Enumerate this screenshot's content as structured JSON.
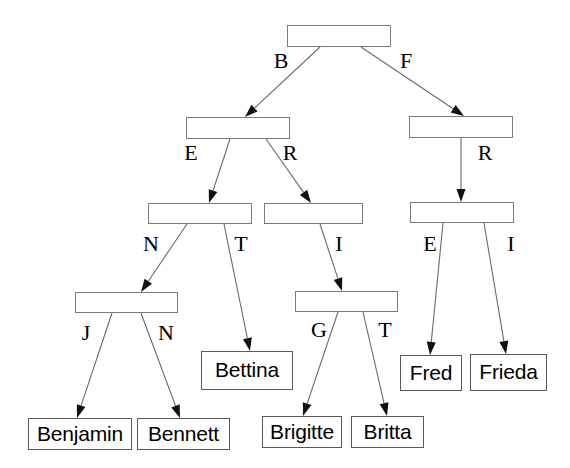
{
  "diagram": {
    "type": "trie",
    "background_color": "#ffffff",
    "box_stroke_color": "#7a7a7a",
    "edge_stroke_color": "#6a6a6a",
    "arrow_fill_color": "#111111",
    "text_color": "#000000"
  },
  "nodes": [
    {
      "id": "root",
      "label": "",
      "kind": "internal",
      "x": 287,
      "y": 25,
      "w": 104,
      "h": 22
    },
    {
      "id": "b",
      "label": "",
      "kind": "internal",
      "x": 186,
      "y": 117,
      "w": 104,
      "h": 22
    },
    {
      "id": "f",
      "label": "",
      "kind": "internal",
      "x": 409,
      "y": 116,
      "w": 104,
      "h": 22
    },
    {
      "id": "be",
      "label": "",
      "kind": "internal",
      "x": 148,
      "y": 203,
      "w": 104,
      "h": 21
    },
    {
      "id": "br",
      "label": "",
      "kind": "internal",
      "x": 264,
      "y": 203,
      "w": 99,
      "h": 21
    },
    {
      "id": "fr",
      "label": "",
      "kind": "internal",
      "x": 410,
      "y": 202,
      "w": 104,
      "h": 21
    },
    {
      "id": "ben",
      "label": "",
      "kind": "internal",
      "x": 75,
      "y": 292,
      "w": 103,
      "h": 21
    },
    {
      "id": "bri",
      "label": "",
      "kind": "internal",
      "x": 295,
      "y": 291,
      "w": 103,
      "h": 21
    },
    {
      "id": "bettina",
      "label": "Bettina",
      "kind": "leaf",
      "x": 201,
      "y": 351,
      "w": 92,
      "h": 39
    },
    {
      "id": "fred",
      "label": "Fred",
      "kind": "leaf",
      "x": 400,
      "y": 355,
      "w": 62,
      "h": 36
    },
    {
      "id": "frieda",
      "label": "Frieda",
      "kind": "leaf",
      "x": 470,
      "y": 354,
      "w": 77,
      "h": 37
    },
    {
      "id": "benjamin",
      "label": "Benjamin",
      "kind": "leaf",
      "x": 28,
      "y": 418,
      "w": 104,
      "h": 32
    },
    {
      "id": "bennett",
      "label": "Bennett",
      "kind": "leaf",
      "x": 137,
      "y": 418,
      "w": 93,
      "h": 32
    },
    {
      "id": "brigitte",
      "label": "Brigitte",
      "kind": "leaf",
      "x": 262,
      "y": 416,
      "w": 80,
      "h": 32
    },
    {
      "id": "britta",
      "label": "Britta",
      "kind": "leaf",
      "x": 351,
      "y": 416,
      "w": 73,
      "h": 32
    }
  ],
  "edges": [
    {
      "id": "root-b",
      "label": "B",
      "from": "root",
      "to": "b",
      "x1": 320,
      "y1": 47,
      "x2": 245,
      "y2": 117,
      "lx": 281,
      "ly": 61
    },
    {
      "id": "root-f",
      "label": "F",
      "from": "root",
      "to": "f",
      "x1": 361,
      "y1": 47,
      "x2": 464,
      "y2": 116,
      "lx": 406,
      "ly": 61
    },
    {
      "id": "b-be",
      "label": "E",
      "from": "b",
      "to": "be",
      "x1": 230,
      "y1": 139,
      "x2": 209,
      "y2": 203,
      "lx": 191,
      "ly": 153
    },
    {
      "id": "b-br",
      "label": "R",
      "from": "b",
      "to": "br",
      "x1": 266,
      "y1": 139,
      "x2": 311,
      "y2": 203,
      "lx": 290,
      "ly": 153
    },
    {
      "id": "f-fr",
      "label": "R",
      "from": "f",
      "to": "fr",
      "x1": 461,
      "y1": 138,
      "x2": 461,
      "y2": 202,
      "lx": 485,
      "ly": 153
    },
    {
      "id": "be-ben",
      "label": "N",
      "from": "be",
      "to": "ben",
      "x1": 187,
      "y1": 224,
      "x2": 141,
      "y2": 292,
      "lx": 151,
      "ly": 244
    },
    {
      "id": "be-bettina",
      "label": "T",
      "from": "be",
      "to": "bettina",
      "x1": 224,
      "y1": 224,
      "x2": 250,
      "y2": 351,
      "lx": 241,
      "ly": 244
    },
    {
      "id": "br-bri",
      "label": "I",
      "from": "br",
      "to": "bri",
      "x1": 320,
      "y1": 224,
      "x2": 342,
      "y2": 291,
      "lx": 339,
      "ly": 244
    },
    {
      "id": "fr-fred",
      "label": "E",
      "from": "fr",
      "to": "fred",
      "x1": 443,
      "y1": 223,
      "x2": 430,
      "y2": 355,
      "lx": 430,
      "ly": 244
    },
    {
      "id": "fr-frieda",
      "label": "I",
      "from": "fr",
      "to": "frieda",
      "x1": 484,
      "y1": 223,
      "x2": 506,
      "y2": 354,
      "lx": 511,
      "ly": 244
    },
    {
      "id": "ben-benjamin",
      "label": "J",
      "from": "ben",
      "to": "benjamin",
      "x1": 112,
      "y1": 313,
      "x2": 77,
      "y2": 418,
      "lx": 86,
      "ly": 333
    },
    {
      "id": "ben-bennett",
      "label": "N",
      "from": "ben",
      "to": "bennett",
      "x1": 141,
      "y1": 313,
      "x2": 180,
      "y2": 418,
      "lx": 166,
      "ly": 333
    },
    {
      "id": "bri-brigitte",
      "label": "G",
      "from": "bri",
      "to": "brigitte",
      "x1": 338,
      "y1": 312,
      "x2": 303,
      "y2": 416,
      "lx": 319,
      "ly": 330
    },
    {
      "id": "bri-britta",
      "label": "T",
      "from": "bri",
      "to": "britta",
      "x1": 363,
      "y1": 312,
      "x2": 387,
      "y2": 416,
      "lx": 385,
      "ly": 330
    }
  ]
}
